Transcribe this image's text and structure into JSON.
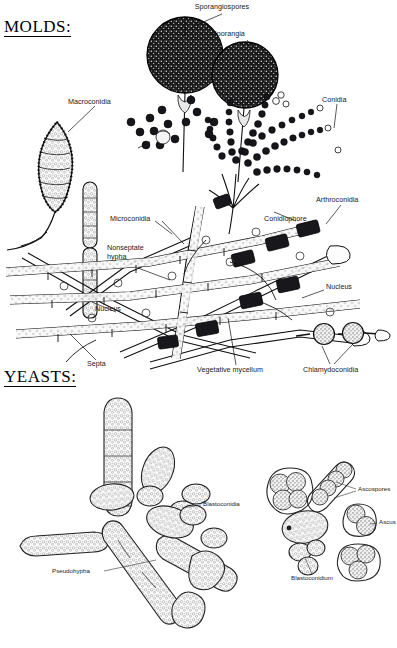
{
  "figure": {
    "background": "#ffffff",
    "ink": "#111111",
    "width": 397,
    "height": 648
  },
  "sections": [
    {
      "id": "molds",
      "heading": "MOLDS:",
      "x": 4,
      "y": 18
    },
    {
      "id": "yeasts",
      "heading": "YEASTS:",
      "x": 4,
      "y": 368
    }
  ],
  "molds": {
    "labels": [
      {
        "name": "sporangiospores",
        "text": "Sporangiospores",
        "x": 222,
        "y": 6,
        "size": "md",
        "align": "c"
      },
      {
        "name": "sporangia",
        "text": "Sporangia",
        "x": 212,
        "y": 32,
        "size": "md",
        "align": "l"
      },
      {
        "name": "conidia",
        "text": "Conidia",
        "x": 322,
        "y": 98,
        "size": "md",
        "align": "l"
      },
      {
        "name": "macroconidia",
        "text": "Macroconidia",
        "x": 68,
        "y": 100,
        "size": "md",
        "align": "l"
      },
      {
        "name": "microconidia",
        "text": "Microconidia",
        "x": 112,
        "y": 218,
        "size": "md",
        "align": "l"
      },
      {
        "name": "conidiophore",
        "text": "Conidiophore",
        "x": 264,
        "y": 218,
        "size": "md",
        "align": "l"
      },
      {
        "name": "arthroconidia",
        "text": "Arthroconidia",
        "x": 316,
        "y": 198,
        "size": "md",
        "align": "l"
      },
      {
        "name": "nonseptate-hypha",
        "text": "Nonseptate hypha",
        "x": 107,
        "y": 246,
        "size": "md",
        "align": "l",
        "wrap": true
      },
      {
        "name": "nucleus-left",
        "text": "Nucleus",
        "x": 95,
        "y": 308,
        "size": "md",
        "align": "l"
      },
      {
        "name": "nucleus-right",
        "text": "Nucleus",
        "x": 326,
        "y": 286,
        "size": "md",
        "align": "l"
      },
      {
        "name": "septa",
        "text": "Septa",
        "x": 87,
        "y": 363,
        "size": "md",
        "align": "l"
      },
      {
        "name": "vegetative-mycelium",
        "text": "Vegetative mycelium",
        "x": 197,
        "y": 368,
        "size": "md",
        "align": "l"
      },
      {
        "name": "chlamydoconidia",
        "text": "Chlamydoconidia",
        "x": 305,
        "y": 368,
        "size": "md",
        "align": "l"
      }
    ],
    "structures": [
      {
        "name": "sporangium-large",
        "kind": "dark-sphere",
        "cx": 185,
        "cy": 55,
        "r": 38
      },
      {
        "name": "sporangium-small",
        "kind": "dark-sphere",
        "cx": 245,
        "cy": 75,
        "r": 33
      },
      {
        "name": "macroconidium",
        "kind": "spindle-septate",
        "cx": 57,
        "cy": 162
      },
      {
        "name": "conidiophore-branch",
        "kind": "branching-chains",
        "cx": 250,
        "cy": 175
      },
      {
        "name": "hyphal-network",
        "kind": "mycelium-mesh",
        "cx": 190,
        "cy": 290
      },
      {
        "name": "chlamydoconidium-a",
        "kind": "round-cell",
        "cx": 324,
        "cy": 334,
        "r": 10
      },
      {
        "name": "chlamydoconidium-b",
        "kind": "round-cell",
        "cx": 353,
        "cy": 333,
        "r": 10
      }
    ]
  },
  "yeasts": {
    "labels": [
      {
        "name": "blastoconidia",
        "text": "Blastoconidia",
        "x": 203,
        "y": 503,
        "size": "sm",
        "align": "l"
      },
      {
        "name": "pseudohypha",
        "text": "Pseudohypha",
        "x": 52,
        "y": 570,
        "size": "sm",
        "align": "l"
      },
      {
        "name": "ascospores",
        "text": "Ascospores",
        "x": 358,
        "y": 488,
        "size": "sm",
        "align": "l"
      },
      {
        "name": "ascus",
        "text": "Ascus",
        "x": 379,
        "y": 521,
        "size": "sm",
        "align": "l"
      },
      {
        "name": "blastoconidium",
        "text": "Blastoconidium",
        "x": 291,
        "y": 577,
        "size": "sm",
        "align": "l"
      }
    ],
    "structures": [
      {
        "name": "pseudohypha-chain",
        "kind": "elongate-cells",
        "cx": 110,
        "cy": 530
      },
      {
        "name": "blastoconidia-cluster",
        "kind": "budding-ovals",
        "cx": 215,
        "cy": 505
      },
      {
        "name": "ascus-cluster-a",
        "kind": "stippled-spores",
        "cx": 287,
        "cy": 493
      },
      {
        "name": "ascus-linear",
        "kind": "stippled-chain",
        "cx": 330,
        "cy": 483
      },
      {
        "name": "ascus-pair",
        "kind": "stippled-pair",
        "cx": 362,
        "cy": 521
      },
      {
        "name": "ascus-triad",
        "kind": "stippled-triad",
        "cx": 357,
        "cy": 563
      },
      {
        "name": "blastoconidium-cell",
        "kind": "budding-oval",
        "cx": 310,
        "cy": 540
      }
    ]
  }
}
